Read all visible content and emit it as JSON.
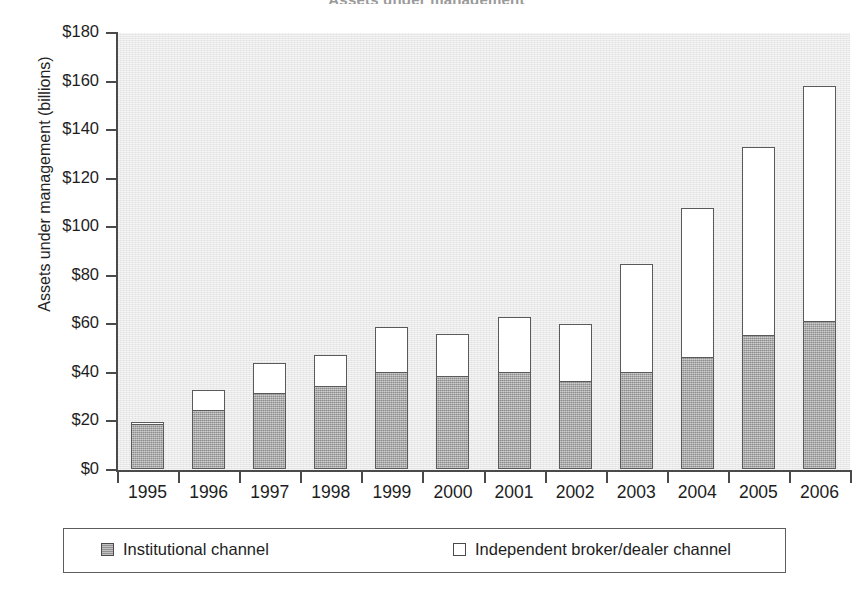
{
  "chart_data": {
    "type": "bar",
    "subtype": "stacked-vertical",
    "title": "Assets under management",
    "xlabel": "",
    "ylabel": "Assets under management (billions)",
    "ylim": [
      0,
      180
    ],
    "ytick_step": 20,
    "ytick_labels": [
      "$0",
      "$20",
      "$40",
      "$60",
      "$80",
      "$100",
      "$120",
      "$140",
      "$160",
      "$180"
    ],
    "ytick_values": [
      0,
      20,
      40,
      60,
      80,
      100,
      120,
      140,
      160,
      180
    ],
    "grid": false,
    "legend_position": "bottom",
    "categories": [
      "1995",
      "1996",
      "1997",
      "1998",
      "1999",
      "2000",
      "2001",
      "2002",
      "2003",
      "2004",
      "2005",
      "2006"
    ],
    "series": [
      {
        "name": "Institutional channel",
        "color": "#a2a2a2",
        "values": [
          18.4,
          24,
          31,
          34,
          40,
          38,
          40,
          36,
          40,
          46,
          55,
          61
        ]
      },
      {
        "name": "Independent broker/dealer channel",
        "color": "#ffffff",
        "values": [
          1.2,
          9,
          13,
          13.5,
          19,
          18,
          23,
          24,
          45,
          62,
          78,
          97
        ]
      }
    ],
    "totals": [
      19.6,
      33,
      44,
      47.5,
      59,
      56,
      63,
      60,
      85,
      108,
      133,
      158
    ],
    "units": "billions of US dollars",
    "axis_color": "#4a4a4a",
    "plot_background": "#e9e9e9"
  },
  "legend": {
    "entries": [
      {
        "label": "Institutional channel",
        "swatch": "filled-gray"
      },
      {
        "label": "Independent broker/dealer channel",
        "swatch": "outline-white"
      }
    ]
  }
}
